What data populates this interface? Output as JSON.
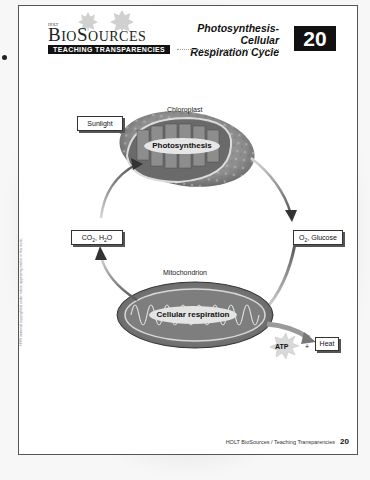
{
  "header": {
    "publisher": "HOLT",
    "brand": "BioSources",
    "series_label": "TEACHING TRANSPARENCIES",
    "title_line1": "Photosynthesis-Cellular",
    "title_line2": "Respiration Cycle",
    "transparency_number": "20"
  },
  "diagram": {
    "chloroplast": {
      "label": "Chloroplast",
      "process": "Photosynthesis"
    },
    "mitochondrion": {
      "label": "Mitochondrion",
      "process": "Cellular respiration"
    },
    "inputs": {
      "sunlight": "Sunlight",
      "co2_h2o": {
        "prefix": "CO",
        "sub1": "2",
        "mid": ", H",
        "sub2": "2",
        "suffix": "O"
      },
      "o2_glucose": {
        "prefix": "O",
        "sub1": "2",
        "suffix": ", Glucose"
      }
    },
    "outputs": {
      "atp": "ATP",
      "plus": "+",
      "heat": "Heat"
    }
  },
  "side_note": "HRW material copyrighted under notice appearing earlier in this work.",
  "footer": {
    "text": "HOLT BioSources / Teaching Transparencies",
    "page_number": "20"
  },
  "colors": {
    "ink": "#111111",
    "badge_bg": "#111111",
    "badge_text": "#ffffff",
    "organelle_gray": "#8a8a8a",
    "arrow_gray": "#6b6b6b"
  }
}
